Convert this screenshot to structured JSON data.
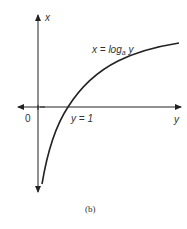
{
  "figure": {
    "caption": "(b)",
    "axes": {
      "vertical_label": "x",
      "horizontal_label": "y",
      "origin_label": "0"
    },
    "curve": {
      "equation_prefix": "x = log",
      "equation_subscript": "a",
      "equation_suffix": " y",
      "intercept_label": "y = 1",
      "color": "#222222"
    }
  }
}
